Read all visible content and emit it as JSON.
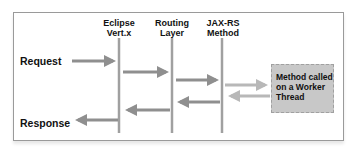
{
  "columns": [
    {
      "label_line1": "Eclipse",
      "label_line2": "Vert.x"
    },
    {
      "label_line1": "Routing",
      "label_line2": "Layer"
    },
    {
      "label_line1": "JAX-RS",
      "label_line2": "Method"
    }
  ],
  "left_labels": {
    "request": "Request",
    "response": "Response"
  },
  "worker_box": {
    "line1": "Method called",
    "line2": "on a Worker",
    "line3": "Thread"
  },
  "colors": {
    "arrow": "#8f8f8f",
    "arrow_light": "#b8b8b8",
    "lifeline": "#a0a0a0",
    "box_fill": "#c8c8c8",
    "frame": "#9a9a9a"
  }
}
